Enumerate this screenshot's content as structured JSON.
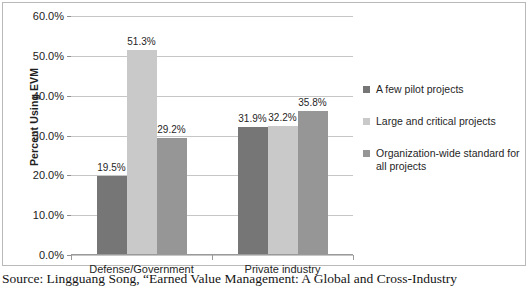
{
  "chart_data": {
    "type": "bar",
    "title": "",
    "xlabel": "",
    "ylabel": "Percent Using EVM",
    "ylim": [
      0,
      60
    ],
    "ytick_labels": [
      "0.0%",
      "10.0%",
      "20.0%",
      "30.0%",
      "40.0%",
      "50.0%",
      "60.0%"
    ],
    "ytick_values": [
      0,
      10,
      20,
      30,
      40,
      50,
      60
    ],
    "grid": true,
    "legend_position": "right",
    "categories": [
      "Defense/Government",
      "Private industry"
    ],
    "series": [
      {
        "name": "A few pilot projects",
        "color": "#767676",
        "values": [
          19.5,
          31.9
        ],
        "labels": [
          "19.5%",
          "31.9%"
        ]
      },
      {
        "name": "Large and critical projects",
        "color": "#c9c9c9",
        "values": [
          51.3,
          32.2
        ],
        "labels": [
          "51.3%",
          "32.2%"
        ]
      },
      {
        "name": "Organization-wide standard for all projects",
        "color": "#969696",
        "values": [
          29.2,
          35.8
        ],
        "labels": [
          "29.2%",
          "35.8%"
        ]
      }
    ]
  },
  "legend": {
    "items": [
      {
        "label": "A few pilot projects",
        "color": "#767676"
      },
      {
        "label": "Large and critical projects",
        "color": "#c9c9c9"
      },
      {
        "label": "Organization-wide standard for all projects",
        "color": "#969696"
      }
    ]
  },
  "caption": {
    "text": "Source: Lingguang Song, “Earned Value Management: A Global and Cross-Industry"
  }
}
